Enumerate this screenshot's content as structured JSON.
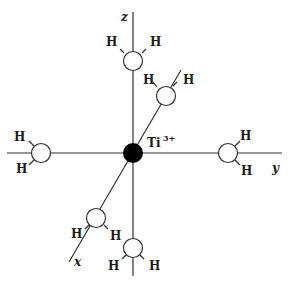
{
  "diagram": {
    "title": "",
    "center_ion": {
      "symbol": "Ti",
      "charge": "3+",
      "color": "#000000"
    },
    "axes": {
      "z": "z",
      "y": "y",
      "x": "x"
    },
    "ligand_atom_label": "H",
    "ligands": [
      {
        "position": "+z",
        "atoms": [
          "H",
          "H"
        ]
      },
      {
        "position": "back-diagonal",
        "atoms": [
          "H",
          "H"
        ]
      },
      {
        "position": "-y",
        "atoms": [
          "H",
          "H"
        ]
      },
      {
        "position": "+y",
        "atoms": [
          "H",
          "H"
        ]
      },
      {
        "position": "+x",
        "atoms": [
          "H",
          "H"
        ]
      },
      {
        "position": "-z",
        "atoms": [
          "H",
          "H"
        ]
      }
    ],
    "ligand_count": 6,
    "colors": {
      "line": "#333333",
      "ligand_fill": "#ffffff",
      "center": "#000000"
    }
  }
}
